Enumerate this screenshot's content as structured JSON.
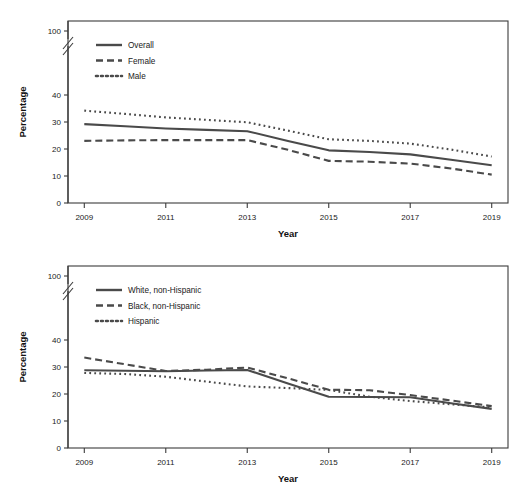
{
  "page": {
    "background_color": "#ffffff",
    "line_color": "#4a4a4a",
    "axis_color": "#3b3b3b"
  },
  "panels": [
    {
      "id": "top",
      "axis_label_y": "Percentage",
      "axis_label_x": "Year",
      "y_ticks": [
        "100",
        "40",
        "30",
        "20",
        "10",
        "0"
      ],
      "x_ticks": [
        "2009",
        "2011",
        "2013",
        "2015",
        "2017",
        "2019"
      ],
      "legend": [
        {
          "label": "Overall",
          "style": "solid"
        },
        {
          "label": "Female",
          "style": "dashed"
        },
        {
          "label": "Male",
          "style": "dotted"
        }
      ]
    },
    {
      "id": "bottom",
      "axis_label_y": "Percentage",
      "axis_label_x": "Year",
      "y_ticks": [
        "100",
        "40",
        "30",
        "20",
        "10",
        "0"
      ],
      "x_ticks": [
        "2009",
        "2011",
        "2013",
        "2015",
        "2017",
        "2019"
      ],
      "legend": [
        {
          "label": "White, non-Hispanic",
          "style": "solid"
        },
        {
          "label": "Black, non-Hispanic",
          "style": "dashed"
        },
        {
          "label": "Hispanic",
          "style": "dotted"
        }
      ]
    }
  ],
  "chart_data": [
    {
      "type": "line",
      "title": "",
      "xlabel": "Year",
      "ylabel": "Percentage",
      "x": [
        2009,
        2010,
        2011,
        2012,
        2013,
        2014,
        2015,
        2016,
        2017,
        2018,
        2019
      ],
      "xticks": [
        2009,
        2011,
        2013,
        2015,
        2017,
        2019
      ],
      "xlim": [
        2008.6,
        2019.4
      ],
      "ylim": [
        0,
        100
      ],
      "yticks": [
        0,
        10,
        20,
        30,
        40,
        100
      ],
      "y_axis_break": {
        "between": [
          40,
          100
        ],
        "present": true
      },
      "grid": false,
      "legend_position": "upper-left",
      "series": [
        {
          "name": "Overall",
          "style": "solid",
          "values": [
            29.2,
            28.4,
            27.6,
            27.1,
            26.6,
            23.0,
            19.5,
            18.9,
            18.0,
            16.0,
            14.0
          ]
        },
        {
          "name": "Female",
          "style": "dashed",
          "values": [
            23.0,
            23.2,
            23.3,
            23.3,
            23.3,
            19.7,
            15.6,
            15.3,
            14.6,
            12.8,
            10.5
          ]
        },
        {
          "name": "Male",
          "style": "dotted",
          "values": [
            34.2,
            33.0,
            31.7,
            30.8,
            29.9,
            26.8,
            23.6,
            23.0,
            22.0,
            19.8,
            17.2
          ]
        }
      ]
    },
    {
      "type": "line",
      "title": "",
      "xlabel": "Year",
      "ylabel": "Percentage",
      "x": [
        2009,
        2010,
        2011,
        2012,
        2013,
        2014,
        2015,
        2016,
        2017,
        2018,
        2019
      ],
      "xticks": [
        2009,
        2011,
        2013,
        2015,
        2017,
        2019
      ],
      "xlim": [
        2008.6,
        2019.4
      ],
      "ylim": [
        0,
        100
      ],
      "yticks": [
        0,
        10,
        20,
        30,
        40,
        100
      ],
      "y_axis_break": {
        "between": [
          40,
          100
        ],
        "present": true
      },
      "grid": false,
      "legend_position": "upper-left",
      "series": [
        {
          "name": "White, non-Hispanic",
          "style": "solid",
          "values": [
            28.8,
            28.6,
            28.4,
            28.7,
            28.9,
            23.9,
            19.0,
            18.9,
            18.8,
            16.6,
            14.5
          ]
        },
        {
          "name": "Black, non-Hispanic",
          "style": "dashed",
          "values": [
            33.5,
            31.0,
            28.5,
            29.0,
            29.8,
            25.8,
            21.6,
            21.4,
            19.6,
            17.6,
            15.5
          ]
        },
        {
          "name": "Hispanic",
          "style": "dotted",
          "values": [
            27.8,
            27.4,
            26.4,
            24.6,
            22.8,
            22.2,
            21.5,
            19.0,
            17.4,
            16.2,
            15.0
          ]
        }
      ]
    }
  ]
}
